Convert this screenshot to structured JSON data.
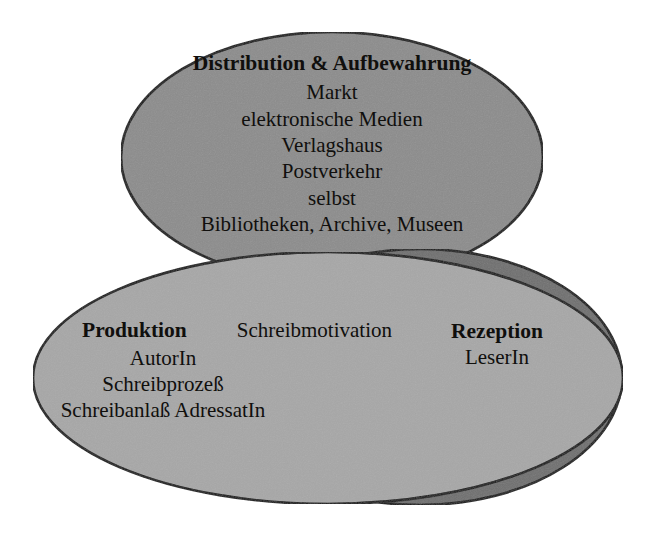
{
  "diagram": {
    "type": "venn-three-ellipses",
    "background_color": "#ffffff",
    "stroke_color": "#111111",
    "text_color": "#100f0d"
  },
  "circles": {
    "distribution": {
      "title": "Distribution & Aufbewahrung",
      "fill_color": "#8c8c8c",
      "items": [
        "Markt",
        "elektronische Medien",
        "Verlagshaus",
        "Postverkehr",
        "selbst",
        "Bibliotheken, Archive, Museen"
      ]
    },
    "produktion": {
      "title": "Produktion",
      "fill_color": "#a7a7a7",
      "side_label": "Schreibmotivation",
      "items": [
        "AutorIn",
        "Schreibprozeß",
        "Schreibanlaß  AdressatIn"
      ]
    },
    "rezeption": {
      "title": "Rezeption",
      "fill_color": "#6f6f6f",
      "items": [
        "LeserIn"
      ]
    }
  }
}
